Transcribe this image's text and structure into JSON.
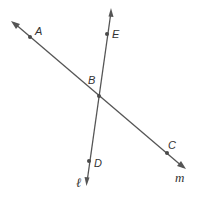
{
  "diagram": {
    "type": "intersecting-lines",
    "lines": [
      {
        "name": "m",
        "label": "m",
        "points": [
          "A",
          "B",
          "C"
        ]
      },
      {
        "name": "l",
        "label": "ℓ",
        "points": [
          "E",
          "B",
          "D"
        ]
      }
    ],
    "points": {
      "A": {
        "label": "A"
      },
      "B": {
        "label": "B"
      },
      "C": {
        "label": "C"
      },
      "D": {
        "label": "D"
      },
      "E": {
        "label": "E"
      }
    },
    "intersection": "B",
    "colors": {
      "line": "#555555",
      "text": "#333333"
    }
  }
}
